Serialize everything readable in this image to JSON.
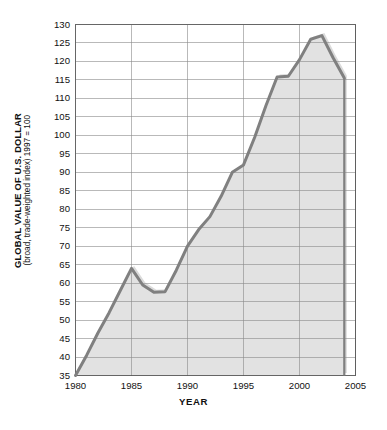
{
  "chart_data": {
    "type": "area",
    "title": "",
    "ylabel": "GLOBAL VALUE OF U.S. DOLLAR",
    "ylabel_sub": "(broad, trade-weighted index) 1997 = 100",
    "xlabel": "YEAR",
    "xlim": [
      1980,
      2005
    ],
    "ylim": [
      35,
      130
    ],
    "xticks": [
      1980,
      1985,
      1990,
      1995,
      2000,
      2005
    ],
    "yticks": [
      35,
      40,
      45,
      50,
      55,
      60,
      65,
      70,
      75,
      80,
      85,
      90,
      95,
      100,
      105,
      110,
      115,
      120,
      125,
      130
    ],
    "grid": true,
    "legend": "none",
    "series": [
      {
        "name": "Global value of U.S. dollar",
        "x": [
          1980,
          1981,
          1982,
          1983,
          1984,
          1985,
          1986,
          1987,
          1988,
          1989,
          1990,
          1991,
          1992,
          1993,
          1994,
          1995,
          1996,
          1997,
          1998,
          1999,
          2000,
          2001,
          2002,
          2003,
          2004
        ],
        "values": [
          35.0,
          40.5,
          46.5,
          52.0,
          58.0,
          64.0,
          59.5,
          57.5,
          57.7,
          63.5,
          70.0,
          74.5,
          78.0,
          83.5,
          90.0,
          92.0,
          99.5,
          108.0,
          115.8,
          116.0,
          120.5,
          126.0,
          127.0,
          121.0,
          115.5
        ]
      }
    ],
    "colors": {
      "line": "#808080",
      "fill": "#e2e2e2",
      "grid": "#8a8a8a",
      "axis": "#555555",
      "shadow": "#bdbdbd",
      "text": "#111111"
    }
  },
  "axes": {
    "y_ticks": [
      "130",
      "125",
      "120",
      "115",
      "110",
      "105",
      "100",
      "95",
      "90",
      "85",
      "80",
      "75",
      "70",
      "65",
      "60",
      "55",
      "50",
      "45",
      "40",
      "35"
    ],
    "x_ticks": [
      "1980",
      "1985",
      "1990",
      "1995",
      "2000",
      "2005"
    ],
    "x_title": "YEAR",
    "y_title_main": "GLOBAL VALUE OF U.S. DOLLAR",
    "y_title_sub": "(broad, trade-weighted index) 1997 = 100"
  }
}
